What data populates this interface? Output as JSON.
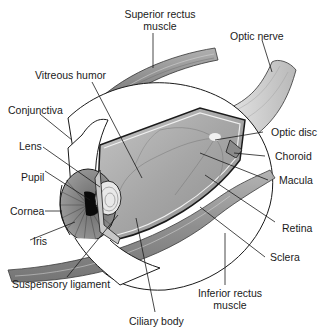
{
  "diagram": {
    "labels": {
      "superior_rectus_line1": "Superior rectus",
      "superior_rectus_line2": "muscle",
      "optic_nerve": "Optic nerve",
      "vitreous_humor": "Vitreous humor",
      "conjunctiva": "Conjunctiva",
      "lens": "Lens",
      "pupil": "Pupil",
      "cornea": "Cornea",
      "iris": "Iris",
      "suspensory_ligament": "Suspensory ligament",
      "ciliary_body": "Ciliary body",
      "optic_disc": "Optic disc",
      "choroid": "Choroid",
      "macula": "Macula",
      "retina": "Retina",
      "sclera": "Sclera",
      "inferior_rectus_line1": "Inferior rectus",
      "inferior_rectus_line2": "muscle"
    },
    "colors": {
      "background": "#ffffff",
      "line": "#1a1a1a",
      "vitreous_fill": "#a8a8a8",
      "muscle_fill": "#9a9a9a",
      "sclera_fill": "#ffffff",
      "pupil_fill": "#0a0a0a"
    }
  }
}
